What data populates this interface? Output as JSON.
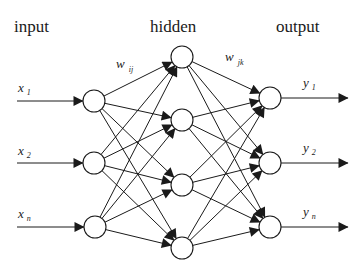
{
  "diagram": {
    "type": "neural-network",
    "layers": [
      {
        "name": "input",
        "title": "input",
        "title_pos": [
          14,
          32
        ],
        "nodes": [
          {
            "id": "i1",
            "cx": 94,
            "cy": 101,
            "label": "x",
            "sub": "1",
            "label_pos": [
              18,
              92
            ]
          },
          {
            "id": "i2",
            "cx": 94,
            "cy": 163,
            "label": "x",
            "sub": "2",
            "label_pos": [
              18,
              155
            ]
          },
          {
            "id": "in",
            "cx": 95,
            "cy": 227,
            "label": "x",
            "sub": "n",
            "label_pos": [
              18,
              218
            ]
          }
        ]
      },
      {
        "name": "hidden",
        "title": "hidden",
        "title_pos": [
          150,
          32
        ],
        "nodes": [
          {
            "id": "h1",
            "cx": 182,
            "cy": 57
          },
          {
            "id": "h2",
            "cx": 182,
            "cy": 120
          },
          {
            "id": "h3",
            "cx": 182,
            "cy": 185
          },
          {
            "id": "h4",
            "cx": 182,
            "cy": 248
          }
        ]
      },
      {
        "name": "output",
        "title": "output",
        "title_pos": [
          276,
          32
        ],
        "nodes": [
          {
            "id": "o1",
            "cx": 270,
            "cy": 98,
            "label": "y",
            "sub": "1",
            "label_pos": [
              303,
              87
            ]
          },
          {
            "id": "o2",
            "cx": 270,
            "cy": 163,
            "label": "y",
            "sub": "2",
            "label_pos": [
              303,
              152
            ]
          },
          {
            "id": "on",
            "cx": 270,
            "cy": 227,
            "label": "y",
            "sub": "n",
            "label_pos": [
              303,
              216
            ]
          }
        ]
      }
    ],
    "weights": [
      {
        "label": "w",
        "sub": "ij",
        "pos": [
          116,
          68
        ]
      },
      {
        "label": "w",
        "sub": "jk",
        "pos": [
          225,
          61
        ]
      }
    ],
    "node_radius": 11,
    "input_arrow_start_x": 17,
    "output_arrow_end_x": 348,
    "colors": {
      "stroke": "#1a1a1a",
      "background": "#ffffff",
      "node_fill": "#ffffff"
    }
  }
}
